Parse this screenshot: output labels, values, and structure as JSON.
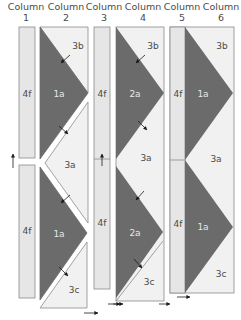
{
  "headers": [
    {
      "line1": "Column",
      "line2": "1"
    },
    {
      "line1": "Column",
      "line2": "2"
    },
    {
      "line1": "Column",
      "line2": "3"
    },
    {
      "line1": "Column",
      "line2": "4"
    },
    {
      "line1": "Column",
      "line2": "5"
    },
    {
      "line1": "Column",
      "line2": "6"
    }
  ],
  "pieces": {
    "col1_top": "4f",
    "col1_bottom": "4f",
    "col2_top_corner": "3b",
    "col2_top_triangle": "1a",
    "col2_middle": "3a",
    "col2_bottom_triangle": "1a",
    "col2_bottom_corner": "3c",
    "col3_top": "4f",
    "col3_bottom": "4f",
    "col4_top_corner": "3b",
    "col4_top_triangle": "2a",
    "col4_middle": "3a",
    "col4_bottom_triangle": "2a",
    "col4_bottom_corner": "3c",
    "col5_top": "4f",
    "col5_bottom": "4f",
    "col6_top_corner": "3b",
    "col6_top_triangle": "1a",
    "col6_middle": "3a",
    "col6_bottom_triangle": "1a",
    "col6_bottom_corner": "3c"
  },
  "colors": {
    "dark_fabric": "#6b6b6b",
    "light_fabric": "#f1f1f1",
    "strip_fabric": "#e6e6e6",
    "outline": "#8a8a8a",
    "arrow": "#1a1a1a"
  }
}
